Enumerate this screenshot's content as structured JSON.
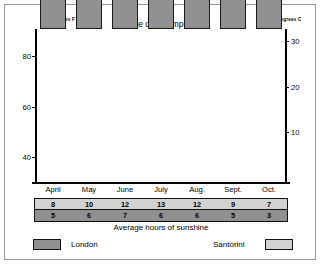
{
  "figure": {
    "title": "Average daily temperature",
    "caption": "Average hours of sunshine",
    "left_axis_caption": "Degrees F",
    "right_axis_caption": "Degrees C"
  },
  "legend": {
    "london_label": "London",
    "santorini_label": "Santorini",
    "london_color": "#909090",
    "santorini_color": "#d2d2d2"
  },
  "axes": {
    "left_ticks": [
      "80",
      "60",
      "40"
    ],
    "right_ticks": [
      "30",
      "20",
      "10"
    ]
  },
  "chart_data": {
    "type": "bar",
    "title": "Average daily temperature",
    "subtitle": "",
    "xlabel": "",
    "ylabel": "Degrees F",
    "y2label": "Degrees C",
    "stacked": true,
    "grid": false,
    "legend_position": "bottom",
    "categories": [
      "April",
      "May",
      "June",
      "July",
      "Aug.",
      "Sept.",
      "Oct."
    ],
    "series": [
      {
        "name": "London",
        "color": "#909090",
        "unit": "degrees F",
        "values": [
          47,
          52,
          59,
          64,
          63,
          60,
          53
        ]
      },
      {
        "name": "Santorini",
        "color": "#d2d2d2",
        "unit": "degrees F",
        "values": [
          61,
          66,
          79,
          84,
          85,
          79,
          70
        ]
      }
    ],
    "ylim": [
      30,
      91
    ],
    "ytick_values": [
      80,
      60,
      40
    ],
    "ytick_labels": [
      "80",
      "60",
      "40"
    ],
    "y2lim": [
      -1.1,
      32.8
    ],
    "y2tick_values": [
      30,
      20,
      10
    ],
    "y2tick_labels": [
      "30",
      "20",
      "10"
    ],
    "table": {
      "caption": "Average hours of sunshine",
      "columns": [
        "April",
        "May",
        "June",
        "July",
        "Aug.",
        "Sept.",
        "Oct."
      ],
      "rows": [
        {
          "name": "Santorini",
          "color": "#d2d2d2",
          "values": [
            "8",
            "10",
            "12",
            "13",
            "12",
            "9",
            "7"
          ]
        },
        {
          "name": "London",
          "color": "#909090",
          "values": [
            "5",
            "6",
            "7",
            "6",
            "6",
            "5",
            "3"
          ]
        }
      ]
    }
  }
}
